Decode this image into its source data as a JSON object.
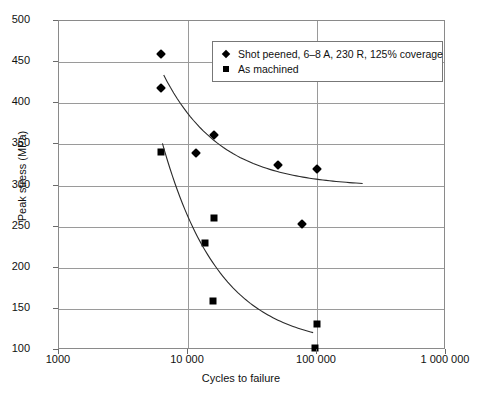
{
  "chart_data": {
    "type": "scatter",
    "title": "",
    "xlabel": "Cycles to failure",
    "ylabel": "Peak stress (MPa)",
    "xscale": "log",
    "xlim": [
      1000,
      1000000
    ],
    "ylim": [
      100,
      500
    ],
    "grid": true,
    "legend_position": "top-right",
    "xticks": [
      {
        "value": 1000,
        "label": "1000"
      },
      {
        "value": 10000,
        "label": "10 000"
      },
      {
        "value": 100000,
        "label": "100 000"
      },
      {
        "value": 1000000,
        "label": "1 000 000"
      }
    ],
    "yticks": [
      {
        "value": 100,
        "label": "100"
      },
      {
        "value": 150,
        "label": "150"
      },
      {
        "value": 200,
        "label": "200"
      },
      {
        "value": 250,
        "label": "250"
      },
      {
        "value": 300,
        "label": "300"
      },
      {
        "value": 350,
        "label": "350"
      },
      {
        "value": 400,
        "label": "400"
      },
      {
        "value": 450,
        "label": "450"
      },
      {
        "value": 500,
        "label": "500"
      }
    ],
    "series": [
      {
        "name": "Shot peened, 6–8 A, 230 R, 125% coverage",
        "marker": "diamond",
        "color": "#000000",
        "points": [
          {
            "x": 6200,
            "y": 460
          },
          {
            "x": 6200,
            "y": 418
          },
          {
            "x": 11500,
            "y": 339
          },
          {
            "x": 16000,
            "y": 362
          },
          {
            "x": 50000,
            "y": 325
          },
          {
            "x": 100000,
            "y": 320
          },
          {
            "x": 76000,
            "y": 253
          }
        ],
        "trend_asymptote": 297
      },
      {
        "name": "As machined",
        "marker": "square",
        "color": "#000000",
        "points": [
          {
            "x": 6200,
            "y": 341
          },
          {
            "x": 13500,
            "y": 230
          },
          {
            "x": 16000,
            "y": 261
          },
          {
            "x": 15500,
            "y": 160
          },
          {
            "x": 100000,
            "y": 132
          },
          {
            "x": 97000,
            "y": 103
          }
        ],
        "trend_asymptote": 102
      }
    ]
  },
  "legend": {
    "entries": [
      {
        "label": "Shot peened, 6–8 A, 230 R, 125% coverage",
        "marker": "diamond"
      },
      {
        "label": "As machined",
        "marker": "square"
      }
    ]
  }
}
